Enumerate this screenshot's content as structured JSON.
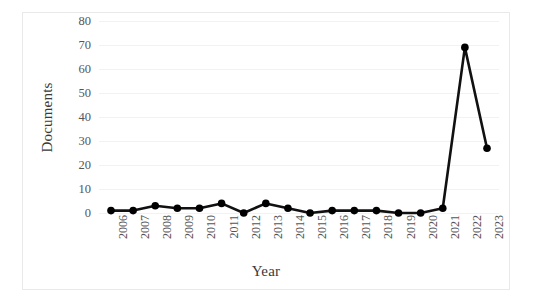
{
  "chart_data": {
    "type": "line",
    "title": "",
    "xlabel": "Year",
    "ylabel": "Documents",
    "categories": [
      "2006",
      "2007",
      "2008",
      "2009",
      "2010",
      "2011",
      "2012",
      "2013",
      "2014",
      "2015",
      "2016",
      "2017",
      "2018",
      "2019",
      "2020",
      "2021",
      "2022",
      "2023"
    ],
    "values": [
      1,
      1,
      3,
      2,
      2,
      4,
      0,
      4,
      2,
      0,
      1,
      1,
      1,
      0,
      0,
      2,
      69,
      27
    ],
    "series": [
      {
        "name": "Documents",
        "values": [
          1,
          1,
          3,
          2,
          2,
          4,
          0,
          4,
          2,
          0,
          1,
          1,
          1,
          0,
          0,
          2,
          69,
          27
        ]
      }
    ],
    "ylim": [
      0,
      80
    ],
    "yticks": [
      0,
      10,
      20,
      30,
      40,
      50,
      60,
      70,
      80
    ],
    "ytick_labels": [
      "0",
      "10",
      "20",
      "30",
      "40",
      "50",
      "60",
      "70",
      "80"
    ],
    "grid": true,
    "grid_axis": "y",
    "legend": "none",
    "marker": "filled-circle",
    "line_color": "#000000",
    "marker_color": "#000000",
    "grid_color": "#f2f2f2",
    "border_color": "#e9e9e9",
    "xtick_rotation": -90
  },
  "axes": {
    "y_title": "Documents",
    "x_title": "Year"
  }
}
